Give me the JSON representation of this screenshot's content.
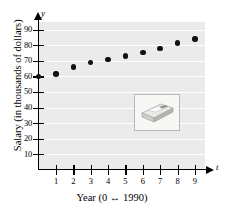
{
  "chart_data": {
    "type": "scatter",
    "title": "",
    "xlabel": "Year (0 ↔ 1990)",
    "ylabel": "Salary (in thousands of dollars)",
    "x_axis_variable": "t",
    "y_axis_variable": "y",
    "x": [
      0,
      1,
      2,
      3,
      4,
      5,
      6,
      7,
      8,
      9
    ],
    "values": [
      60,
      61.5,
      66,
      69,
      71,
      73,
      75.5,
      78,
      81.5,
      84
    ],
    "xlim": [
      0,
      9.8
    ],
    "ylim": [
      0,
      95
    ],
    "x_ticks": [
      "1",
      "2",
      "3",
      "4",
      "5",
      "6",
      "7",
      "8",
      "9"
    ],
    "x_tick_values": [
      1,
      2,
      3,
      4,
      5,
      6,
      7,
      8,
      9
    ],
    "y_ticks": [
      "10",
      "20",
      "30",
      "40",
      "50",
      "60",
      "70",
      "80",
      "90"
    ],
    "y_tick_values": [
      10,
      20,
      30,
      40,
      50,
      60,
      70,
      80,
      90
    ],
    "grid": true,
    "grid_orientation": "horizontal",
    "legend": null,
    "marker_color": "#111111",
    "plot_background": "#ebebeb",
    "gridline_color": "#ffffff",
    "axis_color": "#000000"
  },
  "inset": {
    "name": "stack-of-money-photo",
    "description": "small framed photograph of a stack of banknotes"
  }
}
